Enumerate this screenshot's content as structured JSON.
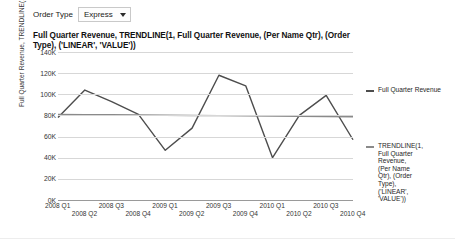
{
  "filter": {
    "label": "Order Type",
    "value": "Express",
    "caret_icon": "chevron-down-icon"
  },
  "chart_data": {
    "type": "line",
    "title": "Full Quarter Revenue, TRENDLINE(1, Full Quarter Revenue, (Per Name Qtr), (Order Type), ('LINEAR', 'VALUE'))",
    "xlabel": "",
    "ylabel": "Full Quarter Revenue, TRENDLINE(1, Full ...",
    "categories": [
      "2008 Q1",
      "2008 Q2",
      "2008 Q3",
      "2008 Q4",
      "2009 Q1",
      "2009 Q2",
      "2009 Q3",
      "2009 Q4",
      "2010 Q1",
      "2010 Q2",
      "2010 Q3",
      "2010 Q4"
    ],
    "ylim": [
      0,
      140000
    ],
    "yticks": [
      "0K",
      "20K",
      "40K",
      "60K",
      "80K",
      "100K",
      "120K",
      "140K"
    ],
    "ytick_values": [
      0,
      20000,
      40000,
      60000,
      80000,
      100000,
      120000,
      140000
    ],
    "grid": true,
    "legend_position": "right",
    "series": [
      {
        "name": "Full Quarter Revenue",
        "color": "#4d4d4d",
        "values": [
          78000,
          104000,
          93000,
          81000,
          47000,
          68000,
          118000,
          108000,
          40000,
          80000,
          99000,
          57000
        ]
      },
      {
        "name": "TRENDLINE(1, Full Quarter Revenue, (Per Name Qtr), (Order Type), ('LINEAR', 'VALUE'))",
        "color": "#8a8a8a",
        "values": [
          81000,
          80800,
          80600,
          80400,
          80200,
          80000,
          79800,
          79600,
          79400,
          79200,
          79000,
          78800
        ]
      }
    ]
  },
  "legend": {
    "items": [
      {
        "label": "Full Quarter Revenue",
        "color": "#4d4d4d"
      },
      {
        "label": "TRENDLINE(1,\nFull Quarter\nRevenue,\n(Per Name\nQtr), (Order\nType),\n('LINEAR',\n'VALUE'))",
        "color": "#8a8a8a"
      }
    ]
  }
}
